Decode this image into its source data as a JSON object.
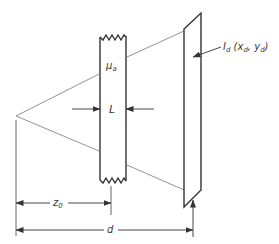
{
  "diagram": {
    "type": "schematic",
    "labels": {
      "absorption": {
        "main": "μ",
        "sub": "a"
      },
      "thickness": "L",
      "detector": {
        "main": "I",
        "sub": "d",
        "paren_open": " (x",
        "x_sub": "d",
        "comma": ", y",
        "y_sub": "d",
        "paren_close": ")"
      },
      "source_distance": {
        "main": "z",
        "sub": "0"
      },
      "detector_distance": "d"
    },
    "colors": {
      "line": "#333333",
      "thin_line": "#666666",
      "text": "#3a3a3a",
      "background": "#ffffff"
    },
    "components": [
      {
        "name": "point-source",
        "label": ""
      },
      {
        "name": "absorbing-slab",
        "label": "μa"
      },
      {
        "name": "detector-plane",
        "label": "Id (xd, yd)"
      }
    ],
    "dimensions": [
      {
        "name": "thickness",
        "label": "L"
      },
      {
        "name": "source-to-slab",
        "label": "z0"
      },
      {
        "name": "source-to-detector",
        "label": "d"
      }
    ]
  }
}
